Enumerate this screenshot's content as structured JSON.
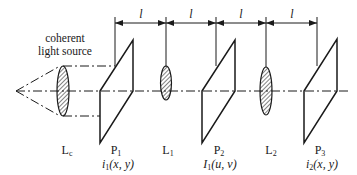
{
  "diagram": {
    "type": "optical 4f-system schematic",
    "source_label": [
      "coherent",
      "light source"
    ],
    "spacing_symbol": "l",
    "spacings": [
      "l",
      "l",
      "l",
      "l"
    ],
    "components": [
      {
        "id": "Lc",
        "label": "L",
        "sub": "c",
        "kind": "lens"
      },
      {
        "id": "P1",
        "label": "P",
        "sub": "1",
        "kind": "plane",
        "field": {
          "sym": "i",
          "sub": "1",
          "args": "(x, y)"
        }
      },
      {
        "id": "L1",
        "label": "L",
        "sub": "1",
        "kind": "lens"
      },
      {
        "id": "P2",
        "label": "P",
        "sub": "2",
        "kind": "plane",
        "field": {
          "sym": "I",
          "sub": "1",
          "args": "(u, v)"
        }
      },
      {
        "id": "L2",
        "label": "L",
        "sub": "2",
        "kind": "lens"
      },
      {
        "id": "P3",
        "label": "P",
        "sub": "3",
        "kind": "plane",
        "field": {
          "sym": "i",
          "sub": "2",
          "args": "(x, y)"
        }
      }
    ],
    "colors": {
      "line": "#1a1a1a",
      "background": "#ffffff"
    }
  }
}
